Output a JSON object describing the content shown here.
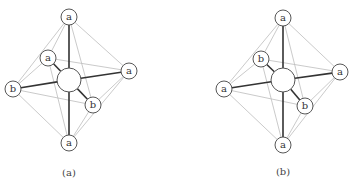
{
  "diagrams": [
    {
      "caption": "(a)",
      "center": {
        "x": 69,
        "y": 80,
        "r": 12
      },
      "nodes": [
        {
          "id": "top",
          "label": "a",
          "x": 69,
          "y": 17
        },
        {
          "id": "back-left",
          "label": "a",
          "x": 48,
          "y": 58
        },
        {
          "id": "right",
          "label": "a",
          "x": 129,
          "y": 71
        },
        {
          "id": "left",
          "label": "b",
          "x": 13,
          "y": 89
        },
        {
          "id": "front-right",
          "label": "b",
          "x": 93,
          "y": 105
        },
        {
          "id": "bottom",
          "label": "a",
          "x": 69,
          "y": 143
        }
      ],
      "caption_pos": {
        "x": 69,
        "y": 172
      }
    },
    {
      "caption": "(b)",
      "center": {
        "x": 283,
        "y": 80,
        "r": 12
      },
      "nodes": [
        {
          "id": "top",
          "label": "a",
          "x": 283,
          "y": 18
        },
        {
          "id": "back-left",
          "label": "b",
          "x": 261,
          "y": 59
        },
        {
          "id": "right",
          "label": "a",
          "x": 340,
          "y": 72
        },
        {
          "id": "left",
          "label": "a",
          "x": 224,
          "y": 89
        },
        {
          "id": "front-right",
          "label": "b",
          "x": 305,
          "y": 106
        },
        {
          "id": "bottom",
          "label": "a",
          "x": 283,
          "y": 145
        }
      ],
      "caption_pos": {
        "x": 283,
        "y": 171
      }
    }
  ],
  "node_radius": 8
}
